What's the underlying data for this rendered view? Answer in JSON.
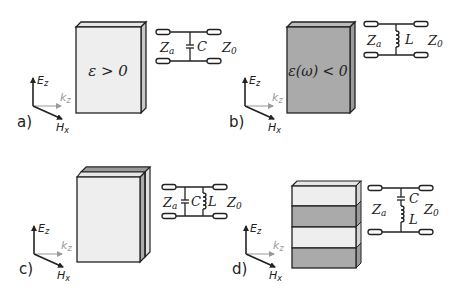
{
  "colors": {
    "light_fill": "#eeeeee",
    "dark_fill": "#aaaaaa",
    "side_fill": "#c8c8c8",
    "outline": "#222222",
    "k_arrow": "#999999"
  },
  "axes_labels": {
    "e": "E",
    "e_sub": "z",
    "k": "k",
    "k_sub": "z",
    "h": "H",
    "h_sub": "x"
  },
  "panels": [
    {
      "id": "a",
      "label": "a)",
      "material_text": "ε > 0",
      "material_fill": "light",
      "circuit": {
        "type": "shunt-C",
        "za": "Z",
        "za_sub": "a",
        "z0": "Z",
        "z0_sub": "0",
        "components": [
          "C"
        ]
      }
    },
    {
      "id": "b",
      "label": "b)",
      "material_text": "ε(ω) < 0",
      "material_fill": "dark",
      "circuit": {
        "type": "shunt-L",
        "za": "Z",
        "za_sub": "a",
        "z0": "Z",
        "z0_sub": "0",
        "components": [
          "L"
        ]
      }
    },
    {
      "id": "c",
      "label": "c)",
      "material_text": "",
      "material_fill": "layered-parallel",
      "circuit": {
        "type": "shunt-parallel-CL",
        "za": "Z",
        "za_sub": "a",
        "z0": "Z",
        "z0_sub": "0",
        "components": [
          "C",
          "L"
        ]
      }
    },
    {
      "id": "d",
      "label": "d)",
      "material_text": "",
      "material_fill": "stacked-stripes",
      "circuit": {
        "type": "shunt-series-CL",
        "za": "Z",
        "za_sub": "a",
        "z0": "Z",
        "z0_sub": "0",
        "components": [
          "C",
          "L"
        ]
      }
    }
  ]
}
